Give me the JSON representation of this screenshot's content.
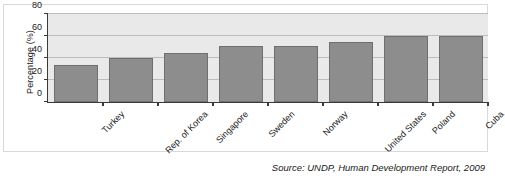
{
  "chart_data": {
    "type": "bar",
    "title": "",
    "subtitle": "",
    "xlabel": "",
    "ylabel": "Percentage (%)",
    "ylim": [
      0,
      80
    ],
    "yticks": [
      0,
      20,
      40,
      60,
      80
    ],
    "ytick_labels": [
      "0",
      "20",
      "40",
      "60",
      "80"
    ],
    "grid": true,
    "legend": false,
    "legend_position": "none",
    "bar_color": "#8d8d8d",
    "bar_edge_color": "#6f6f6f",
    "plot_background": "#e9e9e9",
    "gridline_color": "#bcbcbc",
    "axis_color": "#3a3a3a",
    "categories": [
      "Turkey",
      "Rep. of Korea",
      "Singapore",
      "Sweden",
      "Norway",
      "United States",
      "Poland",
      "Cuba"
    ],
    "values": [
      34,
      40,
      45,
      51,
      51,
      55,
      60,
      60
    ],
    "annotations": []
  },
  "source": {
    "note": "Source: UNDP, Human Development Report, 2009"
  }
}
